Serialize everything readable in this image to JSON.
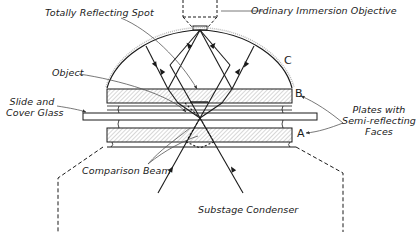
{
  "diagram": {
    "type": "optical-schematic",
    "labels": {
      "totally_reflecting_spot": "Totally Reflecting Spot",
      "ordinary_immersion_objective": "Ordinary Immersion Objective",
      "object": "Object",
      "slide_and_cover_glass_line1": "Slide and",
      "slide_and_cover_glass_line2": "Cover Glass",
      "plates_line1": "Plates with",
      "plates_line2": "Semi-reflecting",
      "plates_line3": "Faces",
      "comparison_beam": "Comparison Beam",
      "substage_condenser": "Substage Condenser"
    },
    "letters": {
      "a": "A",
      "b": "B",
      "c": "C"
    },
    "components": [
      {
        "id": "objective",
        "label": "Ordinary Immersion Objective",
        "style": "dashed"
      },
      {
        "id": "dome-c",
        "label": "C",
        "description": "Hemispherical top element"
      },
      {
        "id": "plate-b",
        "label": "B",
        "description": "Upper plate with semi-reflecting face"
      },
      {
        "id": "slide",
        "label": "Slide and Cover Glass"
      },
      {
        "id": "plate-a",
        "label": "A",
        "description": "Lower plate with semi-reflecting face"
      },
      {
        "id": "condenser",
        "label": "Substage Condenser",
        "style": "dashed"
      }
    ],
    "colors": {
      "ink": "#1a1a1a",
      "hatch": "#8a8a8a",
      "leader": "#555555",
      "background": "#ffffff"
    }
  }
}
